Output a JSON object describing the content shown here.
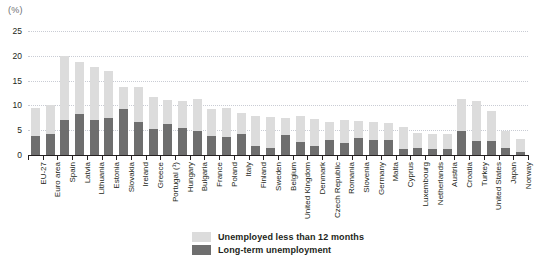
{
  "unit_label": "(%)",
  "legend": {
    "items": [
      {
        "label": "Unemployed less than 12 months",
        "color": "#dcdcdc",
        "key": "short_term"
      },
      {
        "label": "Long-term unemployment",
        "color": "#6e6e6e",
        "key": "long_term"
      }
    ]
  },
  "chart_data": {
    "type": "bar",
    "subtype": "stacked-column",
    "title": "",
    "xlabel": "",
    "ylabel": "(%)",
    "ylim": [
      0,
      25
    ],
    "yticks": [
      0,
      5,
      10,
      15,
      20,
      25
    ],
    "ytick_labels": [
      "0",
      "5",
      "10",
      "15",
      "20",
      "25"
    ],
    "grid": true,
    "grid_style": "dotted-horizontal",
    "legend_position": "bottom-center",
    "categories": [
      "EU-27",
      "Euro area",
      "Spain",
      "Latvia",
      "Lithuania",
      "Estonia",
      "Slovakia",
      "Ireland",
      "Greece",
      "Portugal (¹)",
      "Hungary",
      "Bulgaria",
      "France",
      "Poland",
      "Italy",
      "Finland",
      "Sweden",
      "Belgium",
      "United Kingdom",
      "Denmark",
      "Czech Republic",
      "Romania",
      "Slovenia",
      "Germany",
      "Malta",
      "Cyprus",
      "Luxembourg",
      "Netherlands",
      "Austria",
      "Croatia",
      "Turkey",
      "United States",
      "Japan",
      "Norway"
    ],
    "series": [
      {
        "name": "Long-term unemployment",
        "color": "#6e6e6e",
        "values": [
          3.8,
          4.2,
          7.1,
          8.3,
          7.1,
          7.5,
          9.2,
          6.6,
          5.2,
          6.2,
          5.4,
          4.8,
          3.9,
          3.6,
          4.2,
          1.9,
          1.4,
          4.0,
          2.7,
          1.8,
          3.0,
          2.5,
          3.4,
          3.0,
          3.0,
          1.3,
          1.4,
          1.3,
          1.2,
          4.8,
          2.9,
          2.9,
          1.4,
          0.7
        ]
      },
      {
        "name": "Unemployed less than 12 months",
        "color": "#dcdcdc",
        "values": [
          5.7,
          5.8,
          12.9,
          10.4,
          10.7,
          9.4,
          4.5,
          7.1,
          6.4,
          4.8,
          5.5,
          6.5,
          5.4,
          5.8,
          4.2,
          6.0,
          6.3,
          3.5,
          5.2,
          5.5,
          3.7,
          4.6,
          3.5,
          3.6,
          3.5,
          4.4,
          3.0,
          3.0,
          3.0,
          6.5,
          8.0,
          6.0,
          3.4,
          2.5
        ]
      }
    ],
    "totals": [
      9.5,
      10.0,
      20.0,
      18.7,
      17.8,
      16.9,
      13.7,
      13.7,
      11.6,
      11.0,
      10.9,
      11.3,
      9.3,
      9.4,
      8.4,
      7.9,
      7.7,
      7.5,
      7.9,
      7.3,
      6.7,
      7.1,
      6.9,
      6.6,
      6.5,
      5.7,
      4.4,
      4.3,
      4.2,
      11.3,
      10.9,
      8.9,
      4.8,
      3.2
    ],
    "footnotes": [
      "(¹) Portugal"
    ]
  }
}
